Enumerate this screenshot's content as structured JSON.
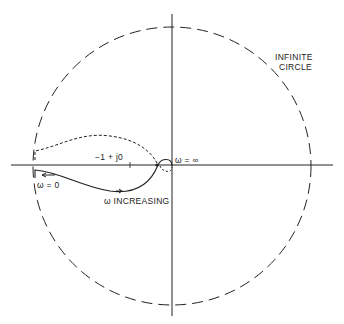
{
  "figure": {
    "type": "Nyquist plot sketch",
    "labels": {
      "infinite_circle_line1": "INFINITE",
      "infinite_circle_line2": "CIRCLE",
      "critical_point": "−1 + j0",
      "omega_infinity": "ω = ∞",
      "omega_zero": "ω = 0",
      "omega_increasing": "ω INCREASING"
    },
    "colors": {
      "ink": "#222222",
      "background": "#ffffff"
    }
  }
}
